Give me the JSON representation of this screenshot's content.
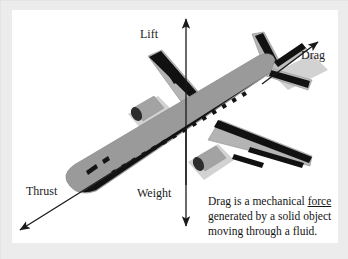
{
  "diagram": {
    "background_color": "#ffffff",
    "mat_color": "#ececec",
    "fuselage_color": "#9a9a9a",
    "wing_color": "#b0b0b0",
    "shadow_color": "#cfcfcf",
    "marking_color": "#111111",
    "arrow_color": "#1a1a1a"
  },
  "forces": [
    {
      "id": "lift",
      "label": "Lift",
      "direction": "up"
    },
    {
      "id": "drag",
      "label": "Drag",
      "direction": "up-right"
    },
    {
      "id": "thrust",
      "label": "Thrust",
      "direction": "down-left"
    },
    {
      "id": "weight",
      "label": "Weight",
      "direction": "down"
    }
  ],
  "caption": {
    "line1_before": "Drag is a mechanical ",
    "line1_link": "force",
    "line2": "generated by a solid object",
    "line3": "moving through a fluid.",
    "full_text": "Drag is a mechanical force generated by a solid object moving through a fluid."
  }
}
